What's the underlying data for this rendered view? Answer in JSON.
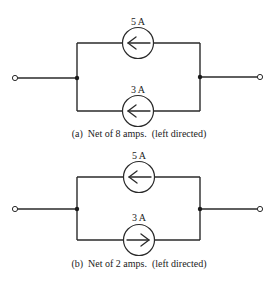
{
  "figure": {
    "circuits": [
      {
        "id": "a",
        "caption": "(a)  Net of 8 amps.  (left directed)",
        "sources": [
          {
            "position": "top",
            "label": "5 A",
            "direction": "left"
          },
          {
            "position": "bottom",
            "label": "3 A",
            "direction": "left"
          }
        ]
      },
      {
        "id": "b",
        "caption": "(b)  Net of 2 amps.  (left directed)",
        "sources": [
          {
            "position": "top",
            "label": "5 A",
            "direction": "left"
          },
          {
            "position": "bottom",
            "label": "3 A",
            "direction": "right"
          }
        ]
      }
    ]
  },
  "colors": {
    "line": "#2a2a2a",
    "background": "#ffffff"
  }
}
